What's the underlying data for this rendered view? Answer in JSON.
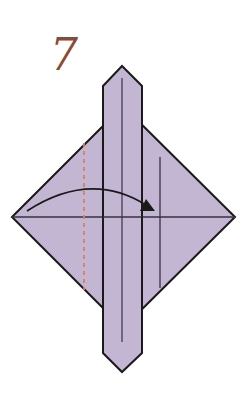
{
  "diagram": {
    "step_number": "7",
    "colors": {
      "paper_fill": "#c2b6d3",
      "outline": "#1a1a1a",
      "crease_line": "#3a3040",
      "fold_line_dashed": "#e07a5f",
      "arrow": "#1a1a1a",
      "step_number": "#8a4a35"
    },
    "shapes": {
      "diamond": {
        "left": [
          12,
          217
        ],
        "top": [
          123,
          106
        ],
        "right": [
          235,
          217
        ],
        "bottom": [
          123,
          328
        ]
      },
      "strip": {
        "left_x": 103,
        "right_x": 142,
        "top_point": [
          122,
          66
        ],
        "shoulder_top_y": 86,
        "shoulder_bottom_y": 353,
        "bottom_point": [
          122,
          372
        ]
      },
      "strip_centerline": {
        "x": 122,
        "y1": 78,
        "y2": 342
      },
      "horizontal_crease": {
        "y": 217,
        "x1": 12,
        "x2": 235
      },
      "right_crease": {
        "x": 160,
        "y1": 157,
        "y2": 288
      },
      "dashed_fold_line": {
        "x": 84,
        "y1": 143,
        "y2": 290
      },
      "fold_arrow": {
        "start": [
          27,
          211
        ],
        "control": [
          90,
          170
        ],
        "end": [
          155,
          211
        ],
        "direction": "left-to-right"
      }
    },
    "icons": {
      "fold_arrow": "curved-arrow-right-icon",
      "fold_line": "valley-fold-dashed-line"
    }
  }
}
